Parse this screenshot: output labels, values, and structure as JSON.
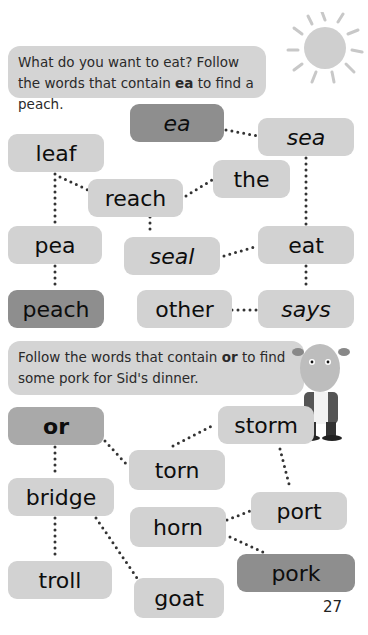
{
  "section1": {
    "instruction_pre": "What do you want to eat? Follow the words that contain ",
    "instruction_key": "ea",
    "instruction_post": " to find a peach.",
    "boxes": {
      "ea": "ea",
      "sea": "sea",
      "leaf": "leaf",
      "the": "the",
      "reach": "reach",
      "pea": "pea",
      "seal": "seal",
      "eat": "eat",
      "peach": "peach",
      "other": "other",
      "says": "says"
    }
  },
  "section2": {
    "instruction_pre": "Follow the words that contain ",
    "instruction_key": "or",
    "instruction_post": " to find some pork for Sid's dinner.",
    "boxes": {
      "or": "or",
      "storm": "storm",
      "torn": "torn",
      "bridge": "bridge",
      "port": "port",
      "horn": "horn",
      "troll": "troll",
      "goat": "goat",
      "pork": "pork"
    }
  },
  "page_number": "27",
  "colors": {
    "box": "#d2d2d2",
    "start_box": "#8e8e8e",
    "end_box": "#8e8e8e",
    "instruction_bg": "#d4d4d4"
  },
  "icons": {
    "sun": "sun-icon",
    "character": "sid-character-illustration"
  }
}
